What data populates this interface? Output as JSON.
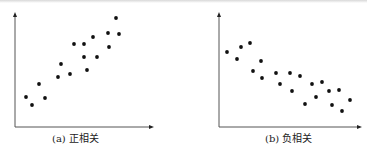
{
  "chart_data": [
    {
      "type": "scatter",
      "title": "(a) 正相关",
      "xlabel": "",
      "ylabel": "",
      "grid": false,
      "legend": null,
      "points": [
        [
          26,
          97
        ],
        [
          32,
          105
        ],
        [
          39,
          84
        ],
        [
          45,
          98
        ],
        [
          58,
          77
        ],
        [
          61,
          64
        ],
        [
          70,
          74
        ],
        [
          74,
          44
        ],
        [
          84,
          44
        ],
        [
          84,
          57
        ],
        [
          87,
          70
        ],
        [
          93,
          37
        ],
        [
          97,
          57
        ],
        [
          108,
          33
        ],
        [
          109,
          47
        ],
        [
          116,
          18
        ],
        [
          119,
          34
        ]
      ],
      "axis": {
        "x0": 15,
        "y0": 127,
        "xend": 153,
        "ytop": 13
      },
      "caption": {
        "text": "(a) 正相关",
        "x": 52,
        "y": 130
      }
    },
    {
      "type": "scatter",
      "title": "(b) 负相关",
      "xlabel": "",
      "ylabel": "",
      "grid": false,
      "legend": null,
      "points": [
        [
          227,
          52
        ],
        [
          237,
          59
        ],
        [
          241,
          47
        ],
        [
          250,
          43
        ],
        [
          253,
          71
        ],
        [
          261,
          61
        ],
        [
          262,
          78
        ],
        [
          276,
          73
        ],
        [
          280,
          84
        ],
        [
          290,
          73
        ],
        [
          292,
          91
        ],
        [
          300,
          76
        ],
        [
          305,
          104
        ],
        [
          312,
          84
        ],
        [
          316,
          97
        ],
        [
          322,
          82
        ],
        [
          329,
          91
        ],
        [
          332,
          105
        ],
        [
          339,
          90
        ],
        [
          342,
          111
        ],
        [
          350,
          100
        ]
      ],
      "axis": {
        "x0": 219,
        "y0": 127,
        "xend": 361,
        "ytop": 13
      },
      "caption": {
        "text": "(b) 负相关",
        "x": 265,
        "y": 130
      }
    }
  ],
  "captions": {
    "a": "(a) 正相关",
    "b": "(b) 负相关"
  },
  "colors": {
    "axis": "#555555",
    "point": "#111111"
  }
}
